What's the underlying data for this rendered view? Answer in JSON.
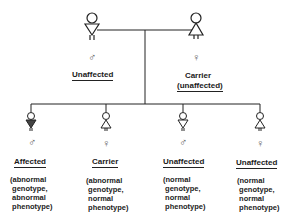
{
  "parents": [
    {
      "id": "father",
      "sex_symbol": "♂",
      "status": "Unaffected",
      "status_line2": "",
      "figure": "male"
    },
    {
      "id": "mother",
      "sex_symbol": "♀",
      "status": "Carrier",
      "status_line2": "(unaffected)",
      "figure": "female"
    }
  ],
  "children": [
    {
      "sex_symbol": "♂",
      "status": "Affected",
      "description": "(abnormal\n genotype,\n abnormal\n phenotype)",
      "figure": "male-affected"
    },
    {
      "sex_symbol": "♀",
      "status": "Carrier",
      "description": "(abnormal\n genotype,\n normal\n phenotype)",
      "figure": "female"
    },
    {
      "sex_symbol": "♂",
      "status": "Unaffected",
      "description": "(normal\n genotype,\n normal\n phenotype)",
      "figure": "male"
    },
    {
      "sex_symbol": "♀",
      "status": "Unaffected",
      "description": "(normal\n genotype,\n normal\n phenotype)",
      "figure": "female"
    }
  ]
}
